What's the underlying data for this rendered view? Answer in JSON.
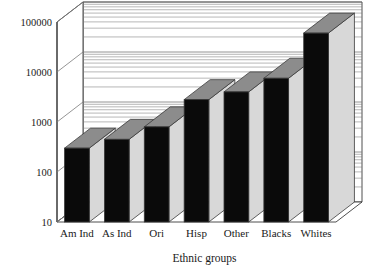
{
  "chart_data": {
    "type": "bar",
    "title": "",
    "xlabel": "Ethnic groups",
    "ylabel": "",
    "yscale": "log",
    "ylim": [
      10,
      100000
    ],
    "ytick_labels": [
      "10",
      "100",
      "1000",
      "10000",
      "100000"
    ],
    "ytick_values": [
      10,
      100,
      1000,
      10000,
      100000
    ],
    "grid": true,
    "grid_minor": true,
    "legend": false,
    "three_d": true,
    "categories": [
      "Am Ind",
      "As Ind",
      "Ori",
      "Hisp",
      "Other",
      "Blacks",
      "Whites"
    ],
    "values": [
      300,
      450,
      800,
      2800,
      4000,
      7500,
      60000
    ],
    "colors": {
      "bar_front": "#0a0a0a",
      "bar_side": "#d8d8d8",
      "bar_top": "#8c8c8c",
      "wall": "#ffffff",
      "floor": "#ffffff",
      "grid": "#7a7a7a",
      "outline": "#3a3a3a",
      "text": "#1a1a1a"
    }
  },
  "axis": {
    "y_ticks": [
      {
        "label": "100000",
        "value": 100000
      },
      {
        "label": "10000",
        "value": 10000
      },
      {
        "label": "1000",
        "value": 1000
      },
      {
        "label": "100",
        "value": 100
      },
      {
        "label": "10",
        "value": 10
      }
    ],
    "x_title": "Ethnic groups"
  },
  "categories": [
    {
      "label": "Am Ind",
      "value": 300
    },
    {
      "label": "As Ind",
      "value": 450
    },
    {
      "label": "Ori",
      "value": 800
    },
    {
      "label": "Hisp",
      "value": 2800
    },
    {
      "label": "Other",
      "value": 4000
    },
    {
      "label": "Blacks",
      "value": 7500
    },
    {
      "label": "Whites",
      "value": 60000
    }
  ]
}
